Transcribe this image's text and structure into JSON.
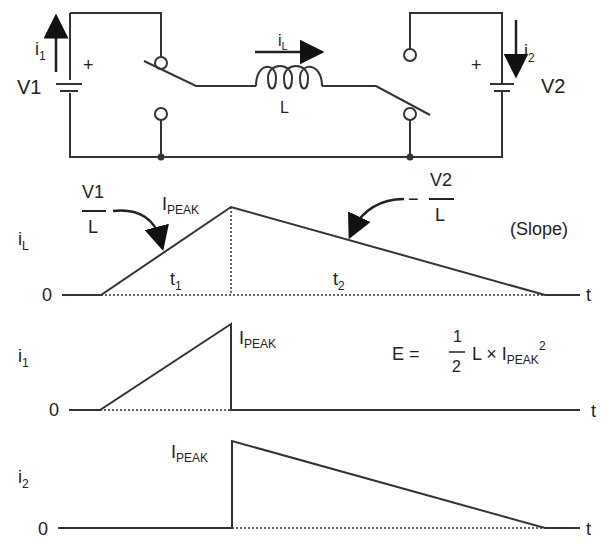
{
  "circuit": {
    "source1": {
      "label": "V1",
      "plus": "+",
      "current": "i",
      "current_sub": "1"
    },
    "source2": {
      "label": "V2",
      "plus": "+",
      "current": "i",
      "current_sub": "2"
    },
    "inductor": {
      "label": "L",
      "current": "i",
      "current_sub": "L"
    }
  },
  "waveforms": {
    "iL": {
      "ylabel": "i",
      "ylabel_sub": "L",
      "zero": "0",
      "xlabel": "t",
      "peak": "I",
      "peak_sub": "PEAK",
      "t1": "t",
      "t1_sub": "1",
      "t2": "t",
      "t2_sub": "2",
      "slope_up_num": "V1",
      "slope_up_den": "L",
      "slope_down_sign": "−",
      "slope_down_num": "V2",
      "slope_down_den": "L",
      "slope_note": "(Slope)"
    },
    "i1": {
      "ylabel": "i",
      "ylabel_sub": "1",
      "zero": "0",
      "xlabel": "t",
      "peak": "I",
      "peak_sub": "PEAK",
      "energy_lhs": "E =",
      "energy_num": "1",
      "energy_den": "2",
      "energy_rhs": "L × I",
      "energy_sub": "PEAK",
      "energy_sup": "2"
    },
    "i2": {
      "ylabel": "i",
      "ylabel_sub": "2",
      "zero": "0",
      "xlabel": "t",
      "peak": "I",
      "peak_sub": "PEAK"
    }
  }
}
